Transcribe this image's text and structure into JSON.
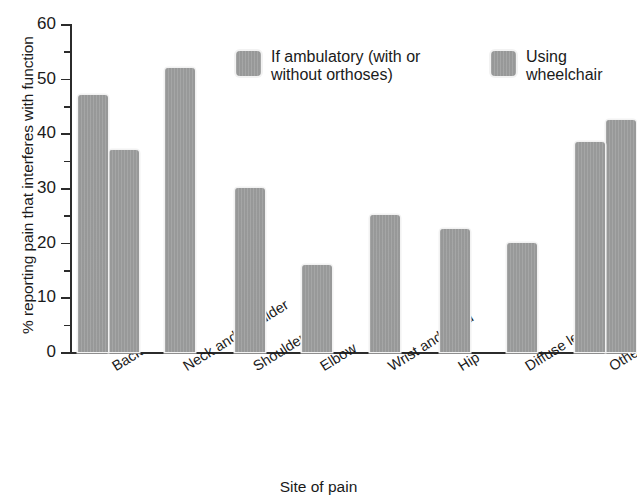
{
  "chart_data": {
    "type": "bar",
    "title": "",
    "xlabel": "Site of pain",
    "ylabel": "% reporting pain that interferes with function",
    "ylim": [
      0,
      60
    ],
    "ytick_labels": [
      "0",
      "10",
      "20",
      "30",
      "40",
      "50",
      "60"
    ],
    "ytick_values": [
      0,
      10,
      20,
      30,
      40,
      50,
      60
    ],
    "yminor_values": [
      5,
      15,
      25,
      35,
      45,
      55
    ],
    "grid": false,
    "legend_position": "upper-center",
    "categories": [
      "Back",
      "Neck and shoulder",
      "Shoulder",
      "Elbow",
      "Wrist and hand",
      "Hip",
      "Diffuse leg",
      "Other"
    ],
    "series": [
      {
        "name": "If ambulatory (with or\nwithout orthoses)",
        "values": [
          47,
          52,
          30,
          16,
          25,
          22.5,
          20,
          38.5
        ]
      },
      {
        "name": "Using\nwheelchair",
        "values": [
          37,
          null,
          null,
          null,
          null,
          null,
          null,
          42.5
        ]
      }
    ],
    "bar_color": "#9a9b9b",
    "axis_color": "#2b2b2b",
    "background_color": "#ffffff"
  },
  "legend": {
    "entries": [
      {
        "label": "If ambulatory (with or\nwithout orthoses)",
        "swatch_name": "legend-swatch-ambulatory"
      },
      {
        "label": "Using\nwheelchair",
        "swatch_name": "legend-swatch-wheelchair"
      }
    ]
  }
}
